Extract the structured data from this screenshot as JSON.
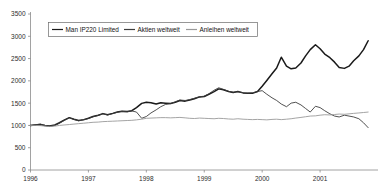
{
  "chart_data": {
    "type": "line",
    "title": "",
    "xlabel": "",
    "ylabel": "",
    "ylim": [
      0,
      3500
    ],
    "xlim": [
      1996,
      2002
    ],
    "grid": false,
    "legend_position": "top-left-inside",
    "y_ticks": [
      "0",
      "500",
      "1000",
      "1500",
      "2000",
      "2500",
      "3000",
      "3500"
    ],
    "x_ticks": [
      "1996",
      "1997",
      "1998",
      "1999",
      "2000",
      "2001"
    ],
    "series": [
      {
        "name": "Man IP220 Limited",
        "color": "#1a1a1a",
        "width": 1.5,
        "x": [
          1996.0,
          1996.08,
          1996.17,
          1996.25,
          1996.33,
          1996.42,
          1996.5,
          1996.58,
          1996.67,
          1996.75,
          1996.83,
          1996.92,
          1997.0,
          1997.08,
          1997.17,
          1997.25,
          1997.33,
          1997.42,
          1997.5,
          1997.58,
          1997.67,
          1997.75,
          1997.83,
          1997.92,
          1998.0,
          1998.08,
          1998.17,
          1998.25,
          1998.33,
          1998.42,
          1998.5,
          1998.58,
          1998.67,
          1998.75,
          1998.83,
          1998.92,
          1999.0,
          1999.08,
          1999.17,
          1999.25,
          1999.33,
          1999.42,
          1999.5,
          1999.58,
          1999.67,
          1999.75,
          1999.83,
          1999.92,
          2000.0,
          2000.08,
          2000.17,
          2000.25,
          2000.33,
          2000.42,
          2000.5,
          2000.58,
          2000.67,
          2000.75,
          2000.83,
          2000.92,
          2001.0,
          2001.08,
          2001.17,
          2001.25,
          2001.33,
          2001.42,
          2001.5,
          2001.58,
          2001.67,
          2001.75,
          2001.83
        ],
        "values": [
          1000,
          1010,
          1020,
          1000,
          985,
          1010,
          1060,
          1120,
          1175,
          1140,
          1110,
          1130,
          1160,
          1200,
          1230,
          1265,
          1240,
          1270,
          1300,
          1320,
          1310,
          1330,
          1400,
          1495,
          1520,
          1510,
          1480,
          1510,
          1500,
          1490,
          1520,
          1560,
          1545,
          1570,
          1600,
          1640,
          1650,
          1700,
          1760,
          1820,
          1800,
          1760,
          1740,
          1760,
          1730,
          1720,
          1720,
          1760,
          1880,
          2010,
          2160,
          2290,
          2530,
          2330,
          2270,
          2290,
          2400,
          2560,
          2700,
          2810,
          2720,
          2600,
          2520,
          2420,
          2300,
          2280,
          2330,
          2450,
          2560,
          2700,
          2900
        ]
      },
      {
        "name": "Aktien weltweit",
        "color": "#3d3d3d",
        "width": 0.9,
        "x": [
          1996.0,
          1996.08,
          1996.17,
          1996.25,
          1996.33,
          1996.42,
          1996.5,
          1996.58,
          1996.67,
          1996.75,
          1996.83,
          1996.92,
          1997.0,
          1997.08,
          1997.17,
          1997.25,
          1997.33,
          1997.42,
          1997.5,
          1997.58,
          1997.67,
          1997.75,
          1997.83,
          1997.92,
          1998.0,
          1998.08,
          1998.17,
          1998.25,
          1998.33,
          1998.42,
          1998.5,
          1998.58,
          1998.67,
          1998.75,
          1998.83,
          1998.92,
          1999.0,
          1999.08,
          1999.17,
          1999.25,
          1999.33,
          1999.42,
          1999.5,
          1999.58,
          1999.67,
          1999.75,
          1999.83,
          1999.92,
          2000.0,
          2000.08,
          2000.17,
          2000.25,
          2000.33,
          2000.42,
          2000.5,
          2000.58,
          2000.67,
          2000.75,
          2000.83,
          2000.92,
          2001.0,
          2001.08,
          2001.17,
          2001.25,
          2001.33,
          2001.42,
          2001.5,
          2001.58,
          2001.67,
          2001.75,
          2001.83
        ],
        "values": [
          1000,
          1015,
          1030,
          1000,
          980,
          1000,
          1050,
          1110,
          1170,
          1135,
          1105,
          1125,
          1155,
          1195,
          1225,
          1260,
          1235,
          1265,
          1295,
          1315,
          1305,
          1325,
          1300,
          1160,
          1200,
          1280,
          1350,
          1420,
          1470,
          1490,
          1530,
          1570,
          1560,
          1580,
          1610,
          1645,
          1655,
          1710,
          1790,
          1845,
          1810,
          1765,
          1745,
          1755,
          1735,
          1725,
          1730,
          1760,
          1780,
          1700,
          1620,
          1560,
          1480,
          1420,
          1500,
          1520,
          1460,
          1380,
          1300,
          1430,
          1400,
          1330,
          1260,
          1210,
          1190,
          1230,
          1210,
          1190,
          1150,
          1060,
          950
        ]
      },
      {
        "name": "Anleihen weltweit",
        "color": "#9a9a9a",
        "width": 0.9,
        "x": [
          1996.0,
          1996.08,
          1996.17,
          1996.25,
          1996.33,
          1996.42,
          1996.5,
          1996.58,
          1996.67,
          1996.75,
          1996.83,
          1996.92,
          1997.0,
          1997.08,
          1997.17,
          1997.25,
          1997.33,
          1997.42,
          1997.5,
          1997.58,
          1997.67,
          1997.75,
          1997.83,
          1997.92,
          1998.0,
          1998.08,
          1998.17,
          1998.25,
          1998.33,
          1998.42,
          1998.5,
          1998.58,
          1998.67,
          1998.75,
          1998.83,
          1998.92,
          1999.0,
          1999.08,
          1999.17,
          1999.25,
          1999.33,
          1999.42,
          1999.5,
          1999.58,
          1999.67,
          1999.75,
          1999.83,
          1999.92,
          2000.0,
          2000.08,
          2000.17,
          2000.25,
          2000.33,
          2000.42,
          2000.5,
          2000.58,
          2000.67,
          2000.75,
          2000.83,
          2000.92,
          2001.0,
          2001.08,
          2001.17,
          2001.25,
          2001.33,
          2001.42,
          2001.5,
          2001.58,
          2001.67,
          2001.75,
          2001.83
        ],
        "values": [
          1000,
          1000,
          995,
          985,
          975,
          985,
          1000,
          1010,
          1020,
          1030,
          1040,
          1050,
          1060,
          1070,
          1075,
          1085,
          1090,
          1095,
          1100,
          1105,
          1110,
          1115,
          1125,
          1140,
          1160,
          1165,
          1170,
          1175,
          1175,
          1170,
          1175,
          1180,
          1170,
          1160,
          1155,
          1165,
          1160,
          1155,
          1150,
          1160,
          1155,
          1145,
          1140,
          1150,
          1140,
          1135,
          1130,
          1135,
          1130,
          1125,
          1135,
          1140,
          1130,
          1140,
          1150,
          1165,
          1180,
          1195,
          1210,
          1215,
          1230,
          1240,
          1235,
          1245,
          1255,
          1250,
          1260,
          1270,
          1280,
          1290,
          1300
        ]
      }
    ]
  },
  "legend": {
    "items": [
      {
        "label": "Man IP220 Limited"
      },
      {
        "label": "Aktien weltweit"
      },
      {
        "label": "Anleihen weltweit"
      }
    ]
  }
}
